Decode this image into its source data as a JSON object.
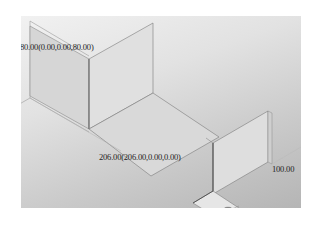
{
  "viewport": {
    "description": "3D CAD viewport showing bent sheet-metal bracket in isometric view",
    "background_top": "#f1f1f1",
    "background_bottom": "#b5b5b5"
  },
  "dimensions": {
    "height_label": "80.00(0.00,0.00,80.00)",
    "length_label": "206.00(206.00,0.00,0.00)",
    "width_label": "100.00"
  },
  "colors": {
    "part_face_light": "#e4e4e4",
    "part_face_mid": "#d2d2d2",
    "part_face_dark": "#c4c4c4",
    "edge": "#6e6e6e",
    "hole": "#7a7a7a"
  }
}
